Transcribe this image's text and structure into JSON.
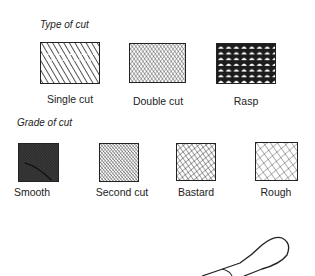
{
  "sections": [
    {
      "heading": "Type of cut",
      "items": [
        {
          "label": "Single cut",
          "pattern": "single-cut"
        },
        {
          "label": "Double cut",
          "pattern": "double-cut"
        },
        {
          "label": "Rasp",
          "pattern": "rasp"
        }
      ]
    },
    {
      "heading": "Grade of cut",
      "items": [
        {
          "label": "Smooth",
          "pattern": "smooth"
        },
        {
          "label": "Second cut",
          "pattern": "second-cut"
        },
        {
          "label": "Bastard",
          "pattern": "bastard"
        },
        {
          "label": "Rough",
          "pattern": "rough"
        }
      ]
    }
  ],
  "illustration": {
    "name": "file-handle-outline"
  },
  "colors": {
    "ink": "#222222",
    "background": "#ffffff"
  }
}
